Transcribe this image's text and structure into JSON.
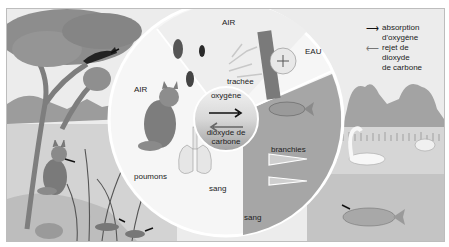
{
  "figure": {
    "topic": "respiration",
    "colors": {
      "background": "#e9e9e9",
      "circle_air": "#f2f2f2",
      "wedge_water": "#a9a9a9",
      "frame_border": "#bdbdbd",
      "oxygen_arrow": "#111111",
      "co2_arrow": "#777777"
    }
  },
  "legend": {
    "items": [
      {
        "icon": "arrow-right-dark-icon",
        "label": "absorption d'oxygène",
        "lines": [
          "absorption",
          "d'oxygène"
        ]
      },
      {
        "icon": "arrow-left-gray-icon",
        "label": "rejet de dioxyde de carbone",
        "lines": [
          "rejet de",
          "dioxyde",
          "de carbone"
        ]
      }
    ]
  },
  "circle": {
    "sections": {
      "air_insects": {
        "title": "AIR",
        "label_trachea": "trachée"
      },
      "air_mammal": {
        "title": "AIR",
        "label_lungs": "poumons",
        "label_blood": "sang"
      },
      "water": {
        "title": "EAU",
        "label_gills": "branchies",
        "label_blood": "sang"
      }
    },
    "center": {
      "top_label": "oxygène",
      "bottom_label_line1": "dioxyde de",
      "bottom_label_line2": "carbone"
    }
  }
}
